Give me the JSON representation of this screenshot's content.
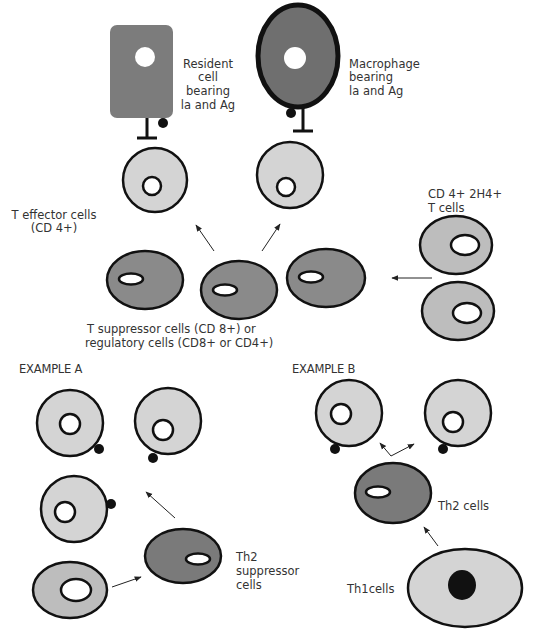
{
  "colors": {
    "dark_cell": "#7a7a7a",
    "mid_cell": "#9a9a9a",
    "light_cell": "#d4d4d4",
    "outline": "#111111",
    "nucleus": "#ffffff",
    "antigen": "#111111"
  },
  "labels": {
    "resident_cell": [
      "Resident",
      "cell",
      "bearing",
      "la and Ag"
    ],
    "macrophage": [
      "Macrophage",
      "bearing",
      "la and Ag"
    ],
    "cd4_2h4": [
      "CD 4+ 2H4+",
      "T cells"
    ],
    "t_effector": [
      "T effector cells",
      "(CD 4+)"
    ],
    "t_suppressor": [
      "T suppressor cells (CD 8+) or",
      "regulatory cells (CD8+ or CD4+)"
    ],
    "example_a": "EXAMPLE A",
    "example_b": "EXAMPLE B",
    "th2_suppressor": [
      "Th2",
      "suppressor",
      "cells"
    ],
    "th2_cells": "Th2 cells",
    "th1_cells": "Th1cells"
  }
}
